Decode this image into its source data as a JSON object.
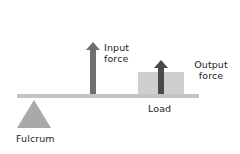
{
  "diagram": {
    "type": "lever",
    "labels": {
      "input_force": [
        "Input",
        "force"
      ],
      "output_force": [
        "Output",
        "force"
      ],
      "load": "Load",
      "fulcrum": "Fulcrum"
    },
    "colors": {
      "beam": "#c4c4c4",
      "fulcrum": "#a9a9a9",
      "input_arrow": "#6f6f6f",
      "output_arrow": "#4a4a4a",
      "load_box": "#cfcfcf",
      "text": "#1e1e1e"
    }
  }
}
